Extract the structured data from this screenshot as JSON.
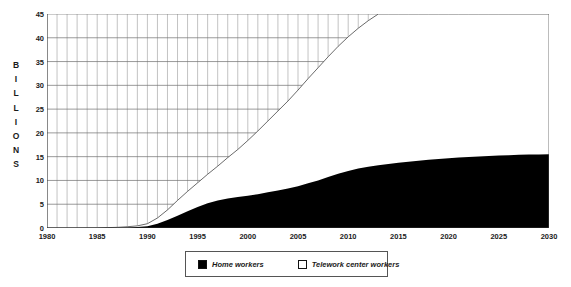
{
  "chart_data": {
    "type": "area",
    "stacked": true,
    "title": "",
    "subtitle": "",
    "xlabel": "",
    "ylabel": "BILLIONS",
    "ylabel_letters": [
      "B",
      "I",
      "L",
      "L",
      "I",
      "O",
      "N",
      "S"
    ],
    "xlim": [
      1980,
      2030
    ],
    "ylim": [
      0,
      45
    ],
    "yticks": [
      0,
      5,
      10,
      15,
      20,
      25,
      30,
      35,
      40,
      45
    ],
    "xticks": [
      1980,
      1985,
      1990,
      1995,
      2000,
      2005,
      2010,
      2015,
      2020,
      2025,
      2030
    ],
    "grid": true,
    "grid_minor_x_step": 1,
    "grid_major_y_step": 5,
    "legend_position": "below",
    "x": [
      1980,
      1981,
      1982,
      1983,
      1984,
      1985,
      1986,
      1987,
      1988,
      1989,
      1990,
      1991,
      1992,
      1993,
      1994,
      1995,
      1996,
      1997,
      1998,
      1999,
      2000,
      2001,
      2002,
      2003,
      2004,
      2005,
      2006,
      2007,
      2008,
      2009,
      2010,
      2011,
      2012,
      2013,
      2014,
      2015,
      2016,
      2017,
      2018,
      2019,
      2020,
      2021,
      2022,
      2023,
      2024,
      2025,
      2026,
      2027,
      2028,
      2029,
      2030
    ],
    "series": [
      {
        "name": "Home workers",
        "color": "#000000",
        "values": [
          0.0,
          0.0,
          0.0,
          0.0,
          0.01,
          0.02,
          0.04,
          0.07,
          0.12,
          0.2,
          0.35,
          0.9,
          1.7,
          2.6,
          3.5,
          4.4,
          5.2,
          5.8,
          6.2,
          6.5,
          6.8,
          7.1,
          7.5,
          7.9,
          8.3,
          8.8,
          9.4,
          10.0,
          10.7,
          11.4,
          12.0,
          12.5,
          12.9,
          13.2,
          13.45,
          13.7,
          13.95,
          14.15,
          14.35,
          14.5,
          14.65,
          14.8,
          14.95,
          15.05,
          15.15,
          15.25,
          15.32,
          15.38,
          15.44,
          15.48,
          15.5
        ]
      },
      {
        "name": "Telework center workers",
        "color": "#ffffff",
        "values": [
          0.0,
          0.0,
          0.0,
          0.0,
          0.01,
          0.02,
          0.04,
          0.07,
          0.14,
          0.25,
          0.55,
          1.2,
          2.1,
          3.2,
          4.2,
          5.1,
          6.1,
          7.2,
          8.6,
          10.0,
          11.6,
          13.3,
          15.0,
          16.7,
          18.4,
          20.2,
          22.0,
          23.7,
          25.3,
          26.8,
          28.2,
          29.5,
          30.7,
          31.8,
          32.8,
          33.7,
          34.6,
          35.4,
          36.2,
          36.9,
          37.6,
          38.2,
          38.8,
          39.4,
          39.9,
          40.4,
          40.8,
          41.2,
          41.6,
          41.9,
          42.2
        ]
      }
    ],
    "totals": [
      0.0,
      0.0,
      0.0,
      0.0,
      0.02,
      0.04,
      0.08,
      0.14,
      0.26,
      0.45,
      0.9,
      2.1,
      3.8,
      5.8,
      7.7,
      9.5,
      11.3,
      13.0,
      14.8,
      16.5,
      18.4,
      20.4,
      22.5,
      24.6,
      26.7,
      29.0,
      31.4,
      33.7,
      36.0,
      38.2,
      40.2,
      42.0,
      43.6,
      45.0,
      46.25,
      47.4,
      48.55,
      49.55,
      50.55,
      51.4,
      52.25,
      53.0,
      53.75,
      54.45,
      55.05,
      55.65,
      56.12,
      56.58,
      57.04,
      57.38,
      57.7
    ]
  },
  "legend": {
    "items": [
      {
        "label": "Home workers",
        "swatch": "black"
      },
      {
        "label": "Telework center workers",
        "swatch": "white"
      }
    ]
  }
}
